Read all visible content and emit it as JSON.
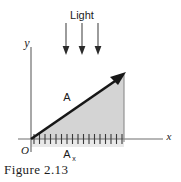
{
  "figure": {
    "caption": "Figure 2.13",
    "labels": {
      "light": "Light",
      "y_axis": "y",
      "x_axis": "x",
      "origin": "O",
      "vector": "A",
      "component": "A",
      "component_subscript": "x"
    },
    "colors": {
      "ink": "#1b1b1b",
      "axis": "#6e6e6e",
      "shade_fill": "#d4d4d4",
      "background": "#ffffff",
      "caption": "#1c1c1c"
    },
    "geometry": {
      "origin": [
        31,
        139
      ],
      "y_axis_top": [
        31,
        47
      ],
      "x_axis_right": [
        163,
        139
      ],
      "vector_tip": [
        124,
        74
      ],
      "shade_right_edge_x": 124,
      "tick_count": 17,
      "tick_start_x": 34,
      "tick_end_x": 122,
      "light_arrow_x": [
        66,
        82,
        98
      ],
      "light_arrow_top_y": 23,
      "light_arrow_bottom_y": 53
    }
  }
}
